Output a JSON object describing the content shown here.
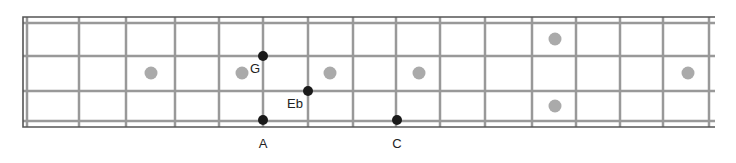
{
  "diagram": {
    "type": "fretboard",
    "strings": 4,
    "string_y": [
      23,
      56,
      91,
      121
    ],
    "frame": {
      "left": 23,
      "top": 17,
      "right": 715,
      "bottom": 127
    },
    "nut_x": 27,
    "fret_x": [
      79,
      126,
      175,
      219,
      263,
      308,
      353,
      396,
      440,
      485,
      532,
      576,
      620,
      663,
      709
    ],
    "inlays": [
      {
        "x": 151,
        "y": 73
      },
      {
        "x": 242,
        "y": 73
      },
      {
        "x": 330,
        "y": 73
      },
      {
        "x": 419,
        "y": 73
      },
      {
        "x": 555,
        "y": 39
      },
      {
        "x": 555,
        "y": 106
      },
      {
        "x": 688,
        "y": 73
      }
    ],
    "notes": [
      {
        "name": "G",
        "x": 263,
        "y": 56,
        "label_x": 255,
        "label_y": 68
      },
      {
        "name": "Eb",
        "x": 308,
        "y": 91,
        "label_x": 295,
        "label_y": 103
      },
      {
        "name": "A",
        "x": 263,
        "y": 120,
        "label_x": 263,
        "label_y": 143
      },
      {
        "name": "C",
        "x": 397,
        "y": 120,
        "label_x": 397,
        "label_y": 143
      }
    ],
    "colors": {
      "frame": "#555555",
      "lines": "#999999",
      "inlay": "#aaaaaa",
      "note": "#1a1a1a",
      "label": "#222222"
    }
  }
}
